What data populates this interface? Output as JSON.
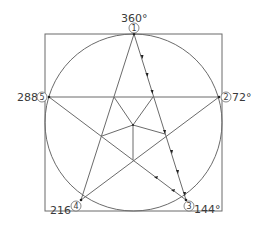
{
  "diagram": {
    "colors": {
      "line": "#6b6b6b",
      "text": "#3a3a3a",
      "background": "#ffffff"
    },
    "points": [
      {
        "id": "1",
        "angle_label": "360°",
        "x": 134,
        "y": 34
      },
      {
        "id": "2",
        "angle_label": "72°",
        "x": 219,
        "y": 97
      },
      {
        "id": "3",
        "angle_label": "144°",
        "x": 186,
        "y": 200
      },
      {
        "id": "4",
        "angle_label": "216°",
        "x": 81,
        "y": 200
      },
      {
        "id": "5",
        "angle_label": "288°",
        "x": 49,
        "y": 97
      }
    ]
  }
}
